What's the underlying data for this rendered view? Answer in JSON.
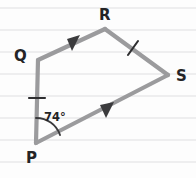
{
  "figure": {
    "type": "geometry-diagram",
    "shape": "quadrilateral",
    "background_style": "ruled-notebook-lines",
    "colors": {
      "edge": "#9b9b9d",
      "label": "#242426",
      "ruled_line": "#e9e9ea",
      "tick": "#2e2e30",
      "arrow": "#3b3b3d",
      "background": "#fdfdfd"
    },
    "vertices": [
      {
        "id": "P",
        "label": "P",
        "x": 36,
        "y": 143,
        "label_x": 26,
        "label_y": 163
      },
      {
        "id": "Q",
        "label": "Q",
        "x": 38,
        "y": 60,
        "label_x": 14,
        "label_y": 61
      },
      {
        "id": "R",
        "label": "R",
        "x": 105,
        "y": 29,
        "label_x": 99,
        "label_y": 20
      },
      {
        "id": "S",
        "label": "S",
        "x": 168,
        "y": 75,
        "label_x": 176,
        "label_y": 81
      }
    ],
    "edges": [
      {
        "id": "PQ",
        "from": "P",
        "to": "Q",
        "ticks": 1,
        "arrows": 0
      },
      {
        "id": "QR",
        "from": "Q",
        "to": "R",
        "ticks": 0,
        "arrows": 1
      },
      {
        "id": "RS",
        "from": "R",
        "to": "S",
        "ticks": 1,
        "arrows": 0
      },
      {
        "id": "PS",
        "from": "P",
        "to": "S",
        "ticks": 0,
        "arrows": 1
      }
    ],
    "angles": [
      {
        "id": "angle-P",
        "at": "P",
        "label": "74°",
        "value": 74,
        "unit": "degrees",
        "label_x": 44,
        "label_y": 121
      }
    ],
    "tick_marks": [
      {
        "id": "tick-pq",
        "on_edge": "PQ",
        "x": 37,
        "y": 98,
        "orientation": "horizontal"
      },
      {
        "id": "tick-rs",
        "on_edge": "RS",
        "x": 133,
        "y": 48,
        "orientation": "slanted"
      }
    ],
    "arrow_marks": [
      {
        "id": "arrow-qr",
        "on_edge": "QR",
        "x": 72,
        "y": 43,
        "direction": "up-right"
      },
      {
        "id": "arrow-ps",
        "on_edge": "PS",
        "x": 106,
        "y": 110,
        "direction": "up-right"
      }
    ],
    "ruled_lines_y": [
      8,
      30,
      52,
      74,
      96,
      118,
      140,
      162
    ]
  }
}
